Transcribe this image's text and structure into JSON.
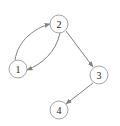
{
  "diagram": {
    "type": "directed-graph",
    "colors": {
      "node_stroke": "#9a9a9a",
      "node_fill": "#ffffff",
      "edge": "#808080",
      "label": "#222222"
    },
    "nodes": [
      {
        "id": "1",
        "label": "1",
        "cx": 18,
        "cy": 69
      },
      {
        "id": "2",
        "label": "2",
        "cx": 59,
        "cy": 24
      },
      {
        "id": "3",
        "label": "3",
        "cx": 99,
        "cy": 75
      },
      {
        "id": "4",
        "label": "4",
        "cx": 59,
        "cy": 110
      }
    ],
    "edges": [
      {
        "from": "1",
        "to": "2",
        "curved": true
      },
      {
        "from": "2",
        "to": "1",
        "curved": true
      },
      {
        "from": "2",
        "to": "3",
        "curved": false
      },
      {
        "from": "3",
        "to": "4",
        "curved": false
      }
    ]
  }
}
